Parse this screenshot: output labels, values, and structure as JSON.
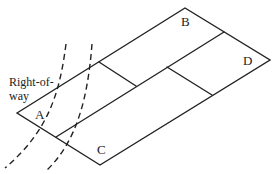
{
  "diagram": {
    "type": "parcel-plan",
    "labels": {
      "right_of_way_line1": "Right-of-",
      "right_of_way_line2": "way",
      "parcel_a": "A",
      "parcel_b": "B",
      "parcel_c": "C",
      "parcel_d": "D"
    },
    "caption_clipped": "",
    "colors": {
      "stroke": "#222222",
      "background": "#ffffff"
    }
  }
}
